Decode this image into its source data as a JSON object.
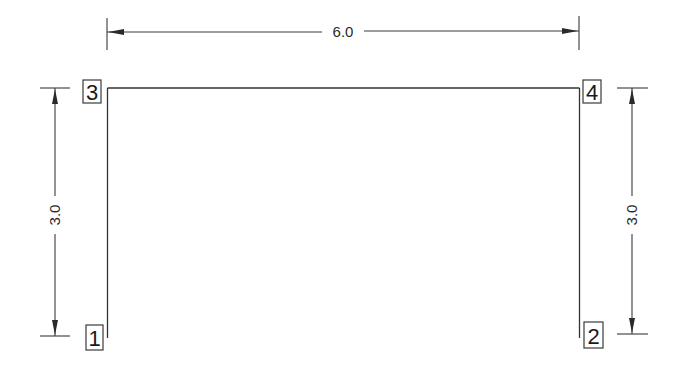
{
  "diagram": {
    "type": "portal-frame",
    "dimensions": {
      "top": {
        "label": "6.0"
      },
      "left": {
        "label": "3.0"
      },
      "right": {
        "label": "3.0"
      }
    },
    "nodes": [
      {
        "id": "1",
        "label": "1",
        "position": "bottom-left"
      },
      {
        "id": "2",
        "label": "2",
        "position": "bottom-right"
      },
      {
        "id": "3",
        "label": "3",
        "position": "top-left"
      },
      {
        "id": "4",
        "label": "4",
        "position": "top-right"
      }
    ],
    "members": [
      {
        "from": "1",
        "to": "3",
        "kind": "column"
      },
      {
        "from": "3",
        "to": "4",
        "kind": "beam"
      },
      {
        "from": "2",
        "to": "4",
        "kind": "column"
      }
    ],
    "colors": {
      "line": "#333333",
      "background": "#ffffff"
    }
  }
}
